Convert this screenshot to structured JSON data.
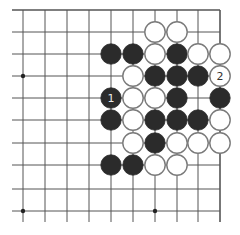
{
  "diagram": {
    "type": "go-board-excerpt",
    "grid": {
      "columns": 10,
      "rows": 10,
      "x": [
        23,
        45,
        67,
        89,
        111,
        133,
        155,
        177,
        198,
        220
      ],
      "y": [
        10,
        32,
        54,
        76,
        98,
        120,
        143,
        165,
        189,
        211
      ],
      "line_color": "#555555",
      "edges": [
        "top",
        "right"
      ]
    },
    "star_points": [
      {
        "col": 0,
        "row": 3
      },
      {
        "col": 0,
        "row": 9
      },
      {
        "col": 6,
        "row": 9
      }
    ],
    "colors": {
      "black_stone": "#2b2b2b",
      "white_stone": "#ffffff",
      "white_stroke": "#7a7a7a",
      "black_label": "#e8e8e8",
      "white_label": "#333333"
    },
    "stones": [
      {
        "col": 6,
        "row": 1,
        "color": "white",
        "label": ""
      },
      {
        "col": 7,
        "row": 1,
        "color": "white",
        "label": ""
      },
      {
        "col": 4,
        "row": 2,
        "color": "black",
        "label": ""
      },
      {
        "col": 5,
        "row": 2,
        "color": "black",
        "label": ""
      },
      {
        "col": 6,
        "row": 2,
        "color": "white",
        "label": ""
      },
      {
        "col": 7,
        "row": 2,
        "color": "black",
        "label": ""
      },
      {
        "col": 8,
        "row": 2,
        "color": "white",
        "label": ""
      },
      {
        "col": 9,
        "row": 2,
        "color": "white",
        "label": ""
      },
      {
        "col": 5,
        "row": 3,
        "color": "white",
        "label": ""
      },
      {
        "col": 6,
        "row": 3,
        "color": "black",
        "label": ""
      },
      {
        "col": 7,
        "row": 3,
        "color": "black",
        "label": ""
      },
      {
        "col": 8,
        "row": 3,
        "color": "black",
        "label": ""
      },
      {
        "col": 9,
        "row": 3,
        "color": "white",
        "label": "2"
      },
      {
        "col": 4,
        "row": 4,
        "color": "black",
        "label": "1"
      },
      {
        "col": 5,
        "row": 4,
        "color": "white",
        "label": ""
      },
      {
        "col": 6,
        "row": 4,
        "color": "white",
        "label": ""
      },
      {
        "col": 7,
        "row": 4,
        "color": "black",
        "label": ""
      },
      {
        "col": 9,
        "row": 4,
        "color": "black",
        "label": ""
      },
      {
        "col": 4,
        "row": 5,
        "color": "black",
        "label": ""
      },
      {
        "col": 5,
        "row": 5,
        "color": "white",
        "label": ""
      },
      {
        "col": 6,
        "row": 5,
        "color": "black",
        "label": ""
      },
      {
        "col": 7,
        "row": 5,
        "color": "black",
        "label": ""
      },
      {
        "col": 8,
        "row": 5,
        "color": "black",
        "label": ""
      },
      {
        "col": 9,
        "row": 5,
        "color": "white",
        "label": ""
      },
      {
        "col": 5,
        "row": 6,
        "color": "white",
        "label": ""
      },
      {
        "col": 6,
        "row": 6,
        "color": "black",
        "label": ""
      },
      {
        "col": 7,
        "row": 6,
        "color": "white",
        "label": ""
      },
      {
        "col": 8,
        "row": 6,
        "color": "white",
        "label": ""
      },
      {
        "col": 9,
        "row": 6,
        "color": "white",
        "label": ""
      },
      {
        "col": 4,
        "row": 7,
        "color": "black",
        "label": ""
      },
      {
        "col": 5,
        "row": 7,
        "color": "black",
        "label": ""
      },
      {
        "col": 6,
        "row": 7,
        "color": "white",
        "label": ""
      },
      {
        "col": 7,
        "row": 7,
        "color": "white",
        "label": ""
      }
    ],
    "move_labels": {
      "move_1": "1",
      "move_2": "2"
    }
  }
}
